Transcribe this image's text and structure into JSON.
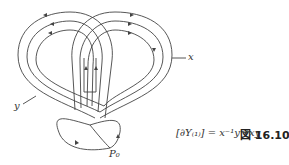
{
  "figure": {
    "labels": {
      "x": "x",
      "y": "y",
      "p0": "P₀"
    },
    "formula": "[∂Y₍₁₎] = x⁻¹y⁻¹xy",
    "caption": "図 16.10"
  }
}
